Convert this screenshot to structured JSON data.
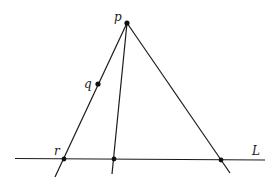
{
  "diagram": {
    "type": "geometry",
    "colors": {
      "stroke": "#1a1a1a",
      "background": "#ffffff"
    },
    "points": {
      "p": {
        "label": "p",
        "x": 127,
        "y": 23
      },
      "q": {
        "label": "q",
        "x": 98,
        "y": 84
      },
      "r": {
        "label": "r",
        "x": 64,
        "y": 159
      },
      "m": {
        "label": "",
        "x": 114,
        "y": 159
      },
      "s": {
        "label": "",
        "x": 221,
        "y": 160
      }
    },
    "lines": {
      "L": {
        "label": "L"
      }
    },
    "labels": {
      "p": "p",
      "q": "q",
      "r": "r",
      "L": "L"
    }
  }
}
